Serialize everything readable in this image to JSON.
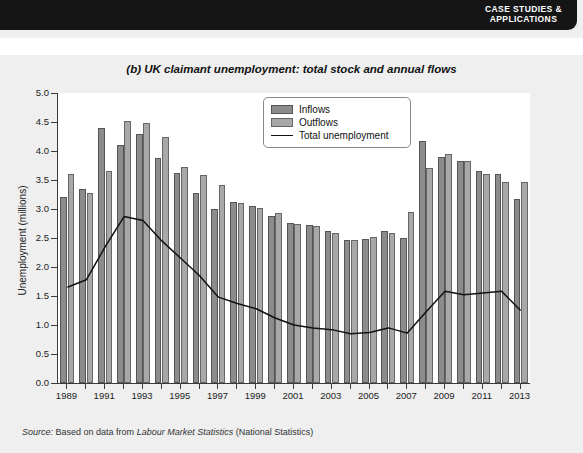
{
  "header": {
    "badge_line1": "CASE STUDIES &",
    "badge_line2": "APPLICATIONS"
  },
  "figure": {
    "label": "(b)",
    "title": "UK claimant unemployment: total stock and annual flows",
    "source_prefix": "Source:",
    "source_text_a": "Based on data from",
    "source_italic": "Labour Market Statistics",
    "source_text_b": "(National Statistics)"
  },
  "legend": {
    "position": "top-center-inside",
    "items": [
      {
        "label": "Inflows",
        "swatch": "inflow",
        "color": "#8c8c8c"
      },
      {
        "label": "Outflows",
        "swatch": "outflow",
        "color": "#a8a8a8"
      },
      {
        "label": "Total unemployment",
        "swatch": "line",
        "color": "#111111"
      }
    ]
  },
  "chart_data": {
    "type": "bar",
    "title": "(b) UK claimant unemployment: total stock and annual flows",
    "xlabel": "",
    "ylabel": "Unemployment (millions)",
    "ylim": [
      0.0,
      5.0
    ],
    "ytick_values": [
      0.0,
      0.5,
      1.0,
      1.5,
      2.0,
      2.5,
      3.0,
      3.5,
      4.0,
      4.5,
      5.0
    ],
    "ytick_labels": [
      "0.0",
      "0.5",
      "1.0",
      "1.5",
      "2.0",
      "2.5",
      "3.0",
      "3.5",
      "4.0",
      "4.5",
      "5.0"
    ],
    "grid": false,
    "categories": [
      1989,
      1990,
      1991,
      1992,
      1993,
      1994,
      1995,
      1996,
      1997,
      1998,
      1999,
      2000,
      2001,
      2002,
      2003,
      2004,
      2005,
      2006,
      2007,
      2008,
      2009,
      2010,
      2011,
      2012,
      2013
    ],
    "xtick_labels": [
      "1989",
      "1991",
      "1993",
      "1995",
      "1997",
      "1999",
      "2001",
      "2003",
      "2005",
      "2007",
      "2009",
      "2011",
      "2013"
    ],
    "xtick_categories": [
      1989,
      1991,
      1993,
      1995,
      1997,
      1999,
      2001,
      2003,
      2005,
      2007,
      2009,
      2011,
      2013
    ],
    "series": [
      {
        "name": "Inflows",
        "kind": "bar",
        "color": "#8c8c8c",
        "values": [
          3.2,
          3.35,
          4.4,
          4.1,
          4.3,
          3.88,
          3.62,
          3.28,
          3.0,
          3.12,
          3.05,
          2.88,
          2.76,
          2.72,
          2.62,
          2.46,
          2.48,
          2.62,
          2.5,
          4.18,
          3.9,
          3.82,
          3.65,
          3.6,
          3.18
        ]
      },
      {
        "name": "Outflows",
        "kind": "bar",
        "color": "#a8a8a8",
        "values": [
          3.6,
          3.28,
          3.65,
          4.52,
          4.48,
          4.25,
          3.73,
          3.58,
          3.42,
          3.1,
          3.02,
          2.93,
          2.75,
          2.7,
          2.58,
          2.47,
          2.52,
          2.58,
          2.95,
          3.7,
          3.95,
          3.82,
          3.6,
          3.47,
          3.47
        ]
      },
      {
        "name": "Total unemployment",
        "kind": "line",
        "color": "#111111",
        "values": [
          1.65,
          1.78,
          2.35,
          2.87,
          2.8,
          2.45,
          2.15,
          1.85,
          1.48,
          1.37,
          1.28,
          1.12,
          1.0,
          0.95,
          0.92,
          0.85,
          0.87,
          0.95,
          0.86,
          1.23,
          1.58,
          1.52,
          1.55,
          1.58,
          1.25
        ]
      }
    ]
  }
}
